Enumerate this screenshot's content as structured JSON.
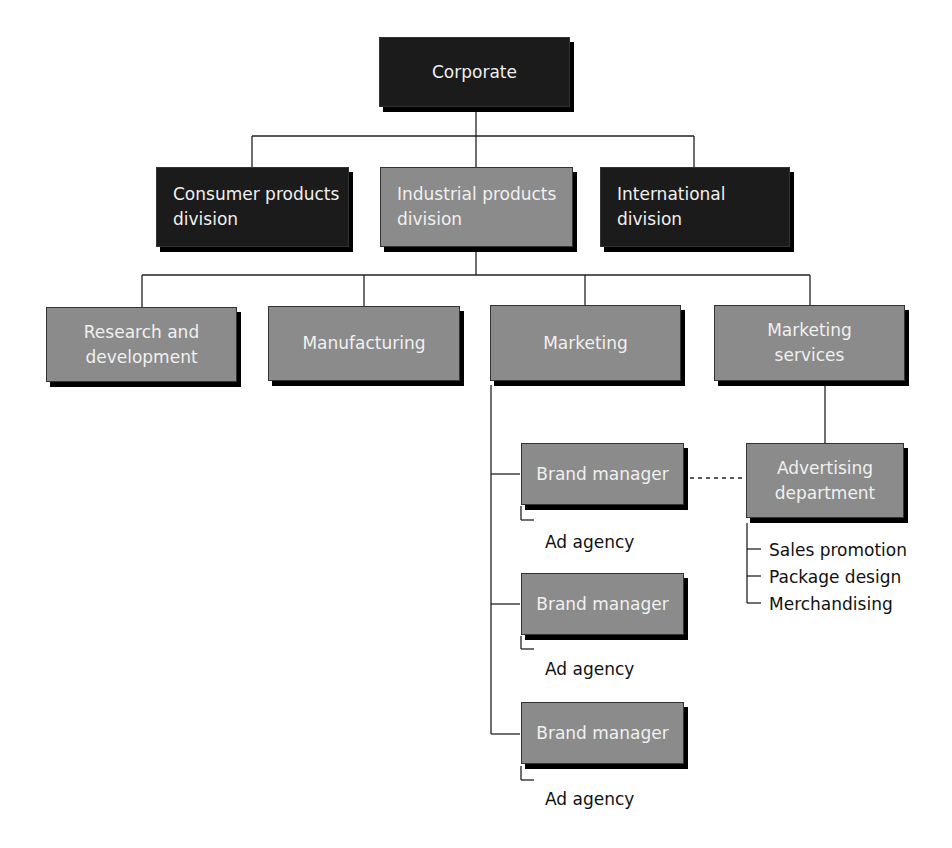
{
  "diagram": {
    "type": "org-chart",
    "colors": {
      "dark_box": "#1b1b1b",
      "gray_box": "#8b8b8b",
      "box_text": "#f0f0f0",
      "line": "#222222",
      "label_text": "#111111"
    },
    "corporate": {
      "line1": "Corporate"
    },
    "divisions": [
      {
        "line1": "Consumer products",
        "line2": "division",
        "style": "dark"
      },
      {
        "line1": "Industrial products",
        "line2": "division",
        "style": "gray"
      },
      {
        "line1": "International",
        "line2": "division",
        "style": "dark"
      }
    ],
    "departments": [
      {
        "line1": "Research and",
        "line2": "development"
      },
      {
        "line1": "Manufacturing"
      },
      {
        "line1": "Marketing"
      },
      {
        "line1": "Marketing",
        "line2": "services"
      }
    ],
    "brand_managers": [
      {
        "label": "Brand manager",
        "sub": "Ad agency"
      },
      {
        "label": "Brand manager",
        "sub": "Ad agency"
      },
      {
        "label": "Brand manager",
        "sub": "Ad agency"
      }
    ],
    "advertising": {
      "line1": "Advertising",
      "line2": "department",
      "subunits": [
        "Sales promotion",
        "Package design",
        "Merchandising"
      ]
    },
    "relationships": {
      "dotted_line": "Brand manager (first) to Advertising department"
    }
  }
}
